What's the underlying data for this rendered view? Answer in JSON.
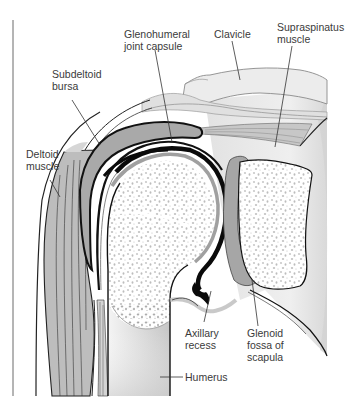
{
  "diagram": {
    "labels": {
      "glenohumeral_joint_capsule": "Glenohumeral\njoint capsule",
      "clavicle": "Clavicle",
      "supraspinatus_muscle": "Supraspinatus\nmuscle",
      "subdeltoid_bursa": "Subdeltoid\nbursa",
      "deltoid_muscle": "Deltoid\nmuscle",
      "axillary_recess": "Axillary\nrecess",
      "glenoid_fossa_of_scapula": "Glenoid\nfossa of\nscapula",
      "humerus": "Humerus"
    },
    "colors": {
      "outline": "#111111",
      "muscle": "#b9b9b9",
      "bone": "#ffffff",
      "cancellous_dots": "#b0b0b0",
      "soft_tissue": "#e4e4e4",
      "bursa": "#a8a8a8",
      "cartilage": "#9e9e9e",
      "leader_line": "#333333"
    }
  }
}
